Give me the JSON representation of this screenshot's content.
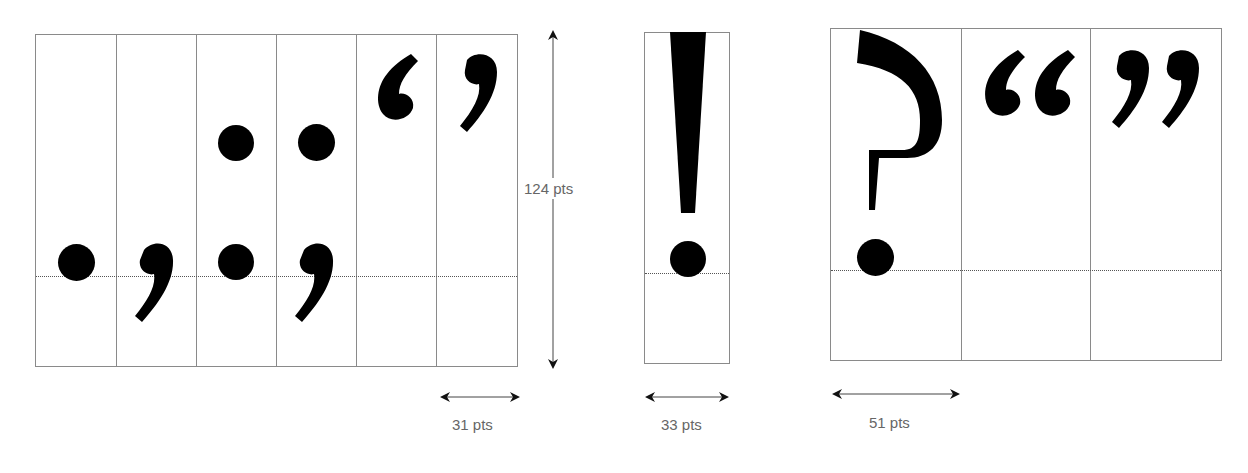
{
  "diagram": {
    "groups": [
      {
        "name": "narrow-punctuation",
        "glyphs": [
          "period",
          "comma",
          "colon",
          "semicolon",
          "left-single-quote",
          "right-single-quote"
        ],
        "width_label": "31 pts"
      },
      {
        "name": "exclamation",
        "glyphs": [
          "exclamation-mark"
        ],
        "width_label": "33 pts"
      },
      {
        "name": "wide-punctuation",
        "glyphs": [
          "question-mark",
          "left-double-quote",
          "right-double-quote"
        ],
        "width_label": "51 pts"
      }
    ],
    "height_label": "124 pts",
    "colors": {
      "glyph": "#000000",
      "grid": "#8a8a8a",
      "baseline": "#555555",
      "label": "#666666"
    }
  }
}
